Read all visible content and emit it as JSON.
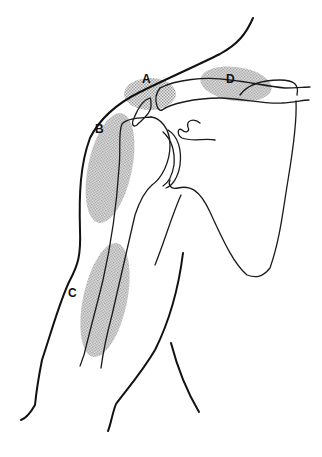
{
  "figure": {
    "type": "anatomical line drawing",
    "regions": [
      {
        "label": "A",
        "location": "acromion / top of shoulder"
      },
      {
        "label": "B",
        "location": "lateral shoulder, over humeral head / deltoid"
      },
      {
        "label": "C",
        "location": "mid upper arm, along humeral shaft"
      },
      {
        "label": "D",
        "location": "along the clavicle"
      }
    ],
    "colors": {
      "line": "#111111",
      "shading": "#9a9a9a",
      "background": "#ffffff"
    }
  }
}
